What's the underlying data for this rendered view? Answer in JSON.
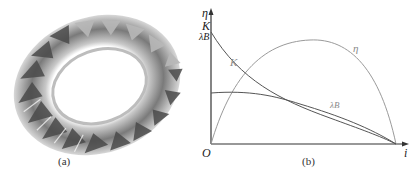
{
  "figure": {
    "panel_a": {
      "caption": "(a)",
      "subject": "turbine-runner-3d-render"
    },
    "panel_b": {
      "caption": "(b)",
      "y_axis_labels": [
        "η",
        "K",
        "λB"
      ],
      "x_axis_label": "i",
      "origin_label": "O",
      "curve_labels": {
        "K": "K",
        "eta": "η",
        "lambda": "λB"
      }
    }
  },
  "colors": {
    "axis": "#333333",
    "curve_K": "#555555",
    "curve_lambda": "#555555",
    "curve_eta": "#9a9a9a",
    "label_light": "#8a8a8a"
  }
}
